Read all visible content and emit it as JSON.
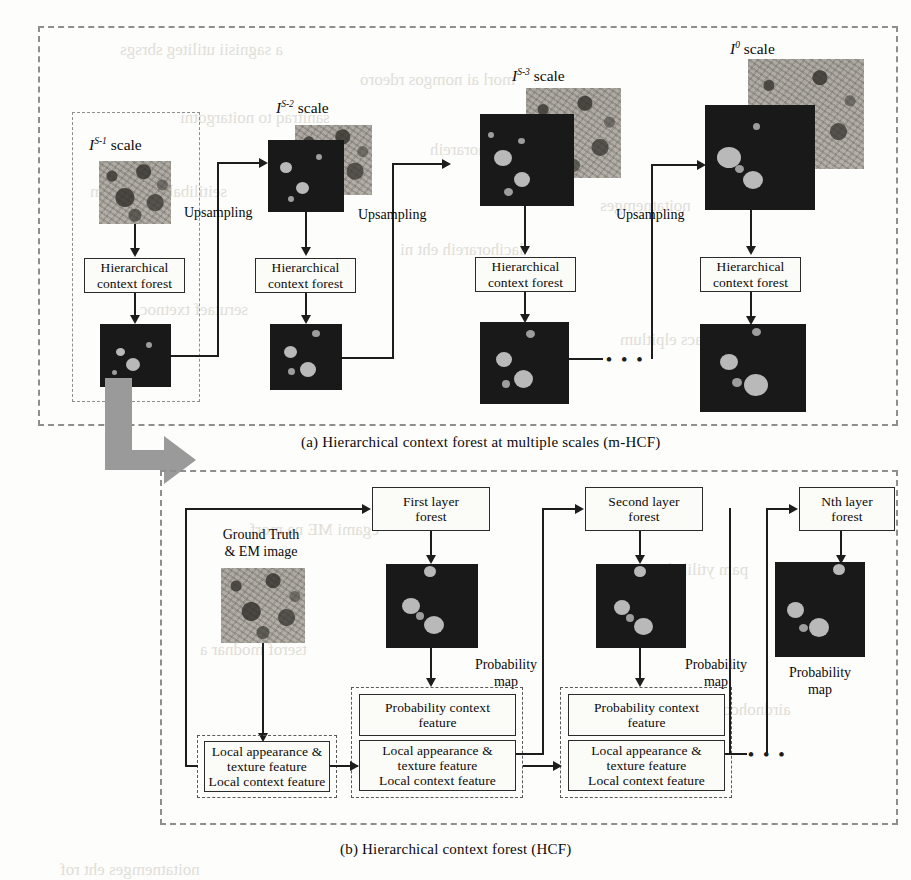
{
  "figure": {
    "panel_a": {
      "caption": "(a)  Hierarchical context forest at multiple scales  (m-HCF)",
      "stages": [
        {
          "id": "stage-s1",
          "scale_label_base": "I",
          "scale_label_sup": "S-1",
          "scale_label_suffix": " scale",
          "forest_box": "Hierarchical\ncontext forest",
          "forest_line1": "Hierarchical",
          "forest_line2": "context forest",
          "upsampling_label": "Upsampling"
        },
        {
          "id": "stage-s2",
          "scale_label_base": "I",
          "scale_label_sup": "S-2",
          "scale_label_suffix": " scale",
          "forest_line1": "Hierarchical",
          "forest_line2": "context forest",
          "upsampling_label": "Upsampling"
        },
        {
          "id": "stage-s3",
          "scale_label_base": "I",
          "scale_label_sup": "S-3",
          "scale_label_suffix": " scale",
          "forest_line1": "Hierarchical",
          "forest_line2": "context forest",
          "upsampling_label": "Upsampling"
        },
        {
          "id": "stage-s0",
          "scale_label_base": "I",
          "scale_label_sup": "0",
          "scale_label_suffix": " scale",
          "forest_line1": "Hierarchical",
          "forest_line2": "context forest",
          "upsampling_label": ""
        }
      ],
      "continuation_dots": "• • •"
    },
    "panel_b": {
      "caption": "(b)  Hierarchical context forest (HCF)",
      "input_label_line1": "Ground Truth",
      "input_label_line2": "& EM  image",
      "layers": [
        {
          "id": "layer-1",
          "forest_line1": "First layer",
          "forest_line2": "forest",
          "prob_label_line1": "Probability",
          "prob_label_line2": "map",
          "prob_context_line1": "Probability context",
          "prob_context_line2": "feature",
          "feature_line1": "Local appearance &",
          "feature_line2": "texture feature",
          "feature_line3": "Local context feature"
        },
        {
          "id": "layer-2",
          "forest_line1": "Second layer",
          "forest_line2": "forest",
          "prob_label_line1": "Probability",
          "prob_label_line2": "map",
          "prob_context_line1": "Probability context",
          "prob_context_line2": "feature",
          "feature_line1": "Local appearance &",
          "feature_line2": "texture feature",
          "feature_line3": "Local context feature"
        },
        {
          "id": "layer-n",
          "forest_line1": "Nth layer",
          "forest_line2": "forest",
          "prob_label_line1": "Probability",
          "prob_label_line2": "map"
        }
      ],
      "initial_feature_box": {
        "line1": "Local appearance &",
        "line2": "texture feature",
        "line3": "Local context feature"
      },
      "continuation_dots": "• • •"
    },
    "colors": {
      "ink": "#1d1d1d",
      "dash_border": "#8e8e8e",
      "probability_map_bg": "#191919",
      "blob": "#b9b9b9",
      "grey_arrow": "#9a9a9a",
      "ghost_text": "#c9c6bd"
    },
    "ghost_text": [
      "scanned page bleed-through",
      "hierarchical context",
      "segmentation of",
      "electron microscopy",
      "probability maps",
      "multiple scales",
      "random forest",
      "mitochondria"
    ]
  }
}
